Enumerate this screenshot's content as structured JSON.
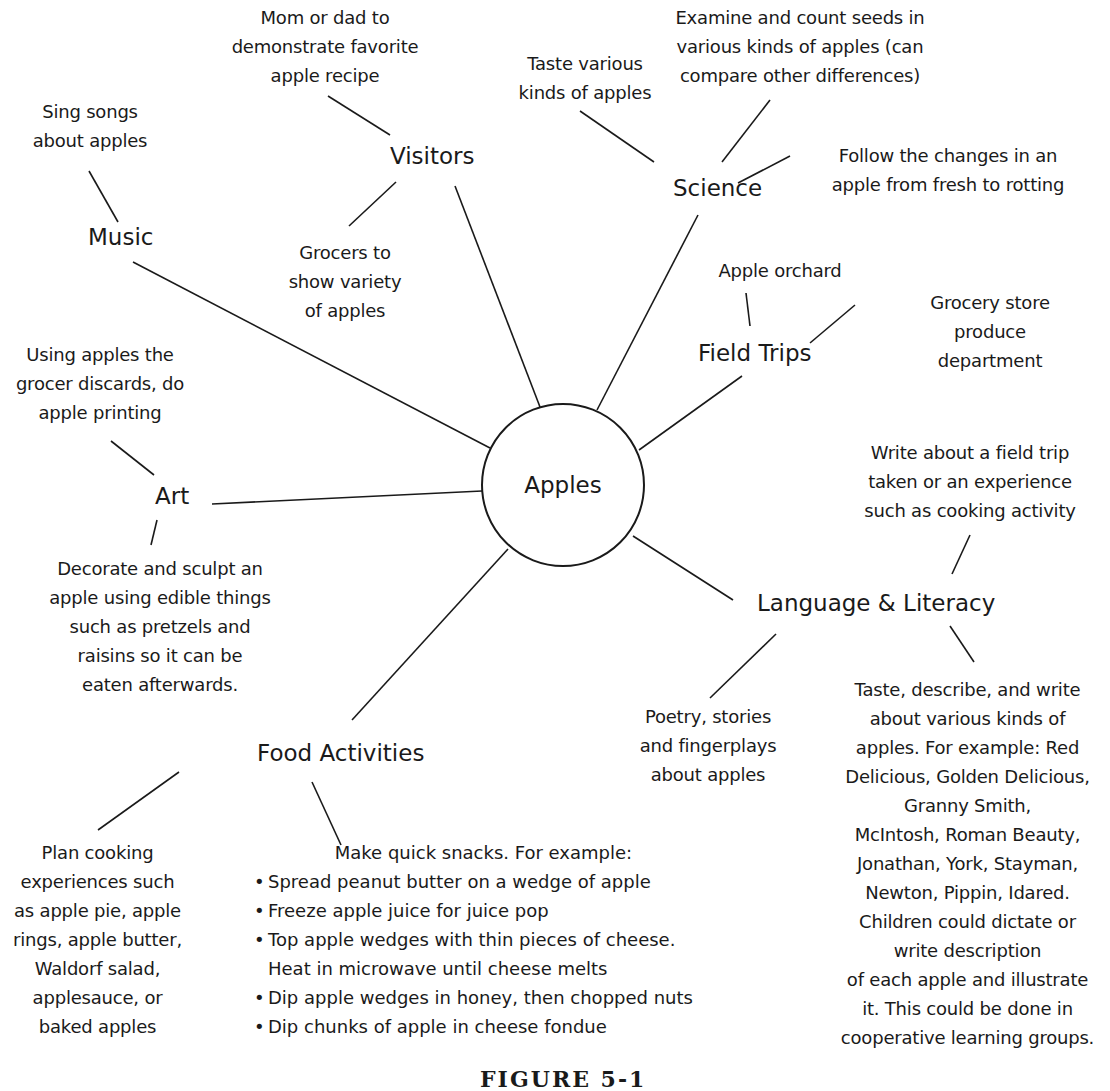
{
  "center": {
    "label": "Apples"
  },
  "topics": {
    "music": {
      "label": "Music",
      "ideas": [
        "Sing songs\nabout apples"
      ]
    },
    "visitors": {
      "label": "Visitors",
      "ideas": [
        "Mom or dad to\ndemonstrate favorite\napple recipe",
        "Grocers to\nshow variety\nof apples"
      ]
    },
    "science": {
      "label": "Science",
      "ideas": [
        "Taste various\nkinds of apples",
        "Examine and count seeds in\nvarious kinds of apples (can\ncompare other differences)",
        "Follow the changes in an\napple from fresh to rotting"
      ]
    },
    "field_trips": {
      "label": "Field Trips",
      "ideas": [
        "Apple orchard",
        "Grocery store\nproduce\ndepartment"
      ]
    },
    "art": {
      "label": "Art",
      "ideas": [
        "Using apples the\ngrocer discards, do\napple printing",
        "Decorate and sculpt an\napple using edible things\nsuch as pretzels and\nraisins so it can be\neaten afterwards."
      ]
    },
    "language_literacy": {
      "label": "Language & Literacy",
      "ideas": [
        "Write about a field trip\ntaken or an experience\nsuch as cooking activity",
        "Poetry, stories\nand fingerplays\nabout apples",
        "Taste, describe, and write\nabout various kinds of\napples. For example: Red\nDelicious, Golden Delicious,\nGranny Smith,\nMcIntosh, Roman Beauty,\nJonathan, York, Stayman,\nNewton, Pippin, Idared.\nChildren could dictate or\nwrite description\nof each apple and illustrate\nit.  This could be done in\ncooperative learning groups."
      ]
    },
    "food_activities": {
      "label": "Food Activities",
      "ideas": [
        "Plan cooking\nexperiences such\nas apple pie, apple\nrings, apple butter,\nWaldorf salad,\napplesauce, or\nbaked apples"
      ],
      "snacks": {
        "heading": "Make quick snacks. For example:",
        "items": [
          "Spread peanut butter on a wedge of apple",
          "Freeze apple juice for juice pop",
          "Top apple wedges with thin pieces of cheese.\nHeat in microwave until cheese melts",
          "Dip apple wedges in honey, then chopped nuts",
          "Dip chunks of apple in cheese fondue"
        ]
      }
    }
  },
  "caption": "FIGURE 5-1"
}
